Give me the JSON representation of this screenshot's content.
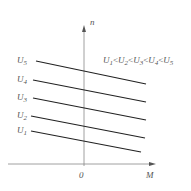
{
  "diagram": {
    "title": "",
    "axes": {
      "y_label": "n",
      "x_label": "M",
      "origin_label": "0"
    },
    "condition": {
      "parts": [
        {
          "base": "U",
          "sub": "1"
        },
        {
          "sep": "<"
        },
        {
          "base": "U",
          "sub": "2"
        },
        {
          "sep": "<"
        },
        {
          "base": "U",
          "sub": "3"
        },
        {
          "sep": "<"
        },
        {
          "base": "U",
          "sub": "4"
        },
        {
          "sep": "<"
        },
        {
          "base": "U",
          "sub": "5"
        }
      ],
      "text": "U1<U2<U3<U4<U5"
    },
    "curves": [
      {
        "label_base": "U",
        "label_sub": "5",
        "x1": 36,
        "y1": 61,
        "x2": 146,
        "y2": 84
      },
      {
        "label_base": "U",
        "label_sub": "4",
        "x1": 33,
        "y1": 80,
        "x2": 146,
        "y2": 102
      },
      {
        "label_base": "U",
        "label_sub": "3",
        "x1": 33,
        "y1": 98,
        "x2": 146,
        "y2": 120
      },
      {
        "label_base": "U",
        "label_sub": "2",
        "x1": 31,
        "y1": 116,
        "x2": 145,
        "y2": 138
      },
      {
        "label_base": "U",
        "label_sub": "1",
        "x1": 31,
        "y1": 131,
        "x2": 141,
        "y2": 152
      }
    ],
    "colors": {
      "line": "#222222",
      "axis": "#888888",
      "text": "#555555"
    }
  }
}
